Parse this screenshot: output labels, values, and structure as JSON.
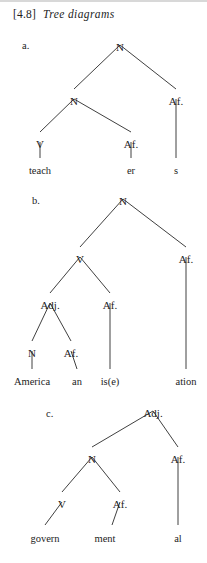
{
  "caption": {
    "number": "[4.8]",
    "title": "Tree diagrams"
  },
  "trees": [
    {
      "label": "a.",
      "label_x": 22,
      "label_y": 40,
      "nodes": [
        {
          "name": "root-n",
          "text": "N",
          "x": 120,
          "y": 42
        },
        {
          "name": "inner-n",
          "text": "N",
          "x": 74,
          "y": 96
        },
        {
          "name": "right-af",
          "text": "Af.",
          "x": 176,
          "y": 96
        },
        {
          "name": "v",
          "text": "V",
          "x": 40,
          "y": 139
        },
        {
          "name": "inner-af",
          "text": "Af.",
          "x": 131,
          "y": 139
        }
      ],
      "leaves": [
        {
          "name": "leaf-teach",
          "text": "teach",
          "x": 40,
          "y": 166
        },
        {
          "name": "leaf-er",
          "text": "er",
          "x": 131,
          "y": 166
        },
        {
          "name": "leaf-s",
          "text": "s",
          "x": 176,
          "y": 166
        }
      ],
      "edges": [
        [
          120,
          45,
          74,
          89
        ],
        [
          120,
          45,
          176,
          89
        ],
        [
          74,
          99,
          40,
          132
        ],
        [
          74,
          99,
          131,
          132
        ],
        [
          40,
          142,
          40,
          158
        ],
        [
          131,
          142,
          131,
          158
        ],
        [
          176,
          99,
          176,
          158
        ]
      ]
    },
    {
      "label": "b.",
      "label_x": 32,
      "label_y": 195,
      "nodes": [
        {
          "name": "root-n",
          "text": "N",
          "x": 123,
          "y": 196
        },
        {
          "name": "v",
          "text": "V",
          "x": 80,
          "y": 254
        },
        {
          "name": "right-af",
          "text": "Af.",
          "x": 186,
          "y": 254
        },
        {
          "name": "adj",
          "text": "Adj.",
          "x": 50,
          "y": 300
        },
        {
          "name": "mid-af",
          "text": "Af.",
          "x": 110,
          "y": 300
        },
        {
          "name": "n",
          "text": "N",
          "x": 32,
          "y": 348
        },
        {
          "name": "inner-af",
          "text": "Af.",
          "x": 71,
          "y": 348
        }
      ],
      "leaves": [
        {
          "name": "leaf-america",
          "text": "America",
          "x": 32,
          "y": 377
        },
        {
          "name": "leaf-an",
          "text": "an",
          "x": 77,
          "y": 377
        },
        {
          "name": "leaf-ise",
          "text": "is(e)",
          "x": 110,
          "y": 377
        },
        {
          "name": "leaf-ation",
          "text": "ation",
          "x": 186,
          "y": 377
        }
      ],
      "edges": [
        [
          123,
          199,
          80,
          247
        ],
        [
          123,
          199,
          186,
          247
        ],
        [
          80,
          257,
          50,
          293
        ],
        [
          80,
          257,
          110,
          293
        ],
        [
          50,
          303,
          32,
          341
        ],
        [
          50,
          303,
          71,
          341
        ],
        [
          32,
          351,
          32,
          369
        ],
        [
          71,
          351,
          77,
          369
        ],
        [
          110,
          303,
          110,
          369
        ],
        [
          186,
          257,
          186,
          369
        ]
      ]
    },
    {
      "label": "c.",
      "label_x": 46,
      "label_y": 408,
      "nodes": [
        {
          "name": "root-adj",
          "text": "Adj.",
          "x": 153,
          "y": 408
        },
        {
          "name": "n",
          "text": "N",
          "x": 92,
          "y": 454
        },
        {
          "name": "right-af",
          "text": "Af.",
          "x": 178,
          "y": 454
        },
        {
          "name": "v",
          "text": "V",
          "x": 62,
          "y": 499
        },
        {
          "name": "inner-af",
          "text": "Af.",
          "x": 120,
          "y": 499
        }
      ],
      "leaves": [
        {
          "name": "leaf-govern",
          "text": "govern",
          "x": 45,
          "y": 534
        },
        {
          "name": "leaf-ment",
          "text": "ment",
          "x": 105,
          "y": 534
        },
        {
          "name": "leaf-al",
          "text": "al",
          "x": 178,
          "y": 534
        }
      ],
      "edges": [
        [
          153,
          411,
          92,
          447
        ],
        [
          153,
          411,
          178,
          447
        ],
        [
          92,
          457,
          62,
          492
        ],
        [
          92,
          457,
          120,
          492
        ],
        [
          62,
          502,
          45,
          525
        ],
        [
          120,
          502,
          112,
          525
        ],
        [
          178,
          457,
          178,
          525
        ]
      ]
    }
  ],
  "colors": {
    "ink": "#1d1d1d",
    "line": "#2a2a2a",
    "background": "#ffffff"
  }
}
